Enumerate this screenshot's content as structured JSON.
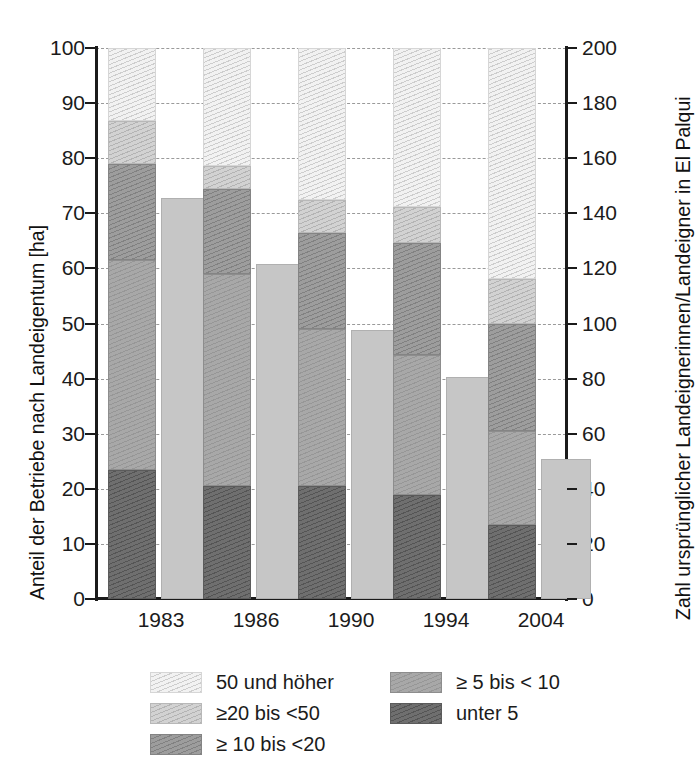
{
  "chart_data": {
    "type": "bar",
    "title": "",
    "subtitle": "",
    "categories": [
      "1983",
      "1986",
      "1990",
      "1994",
      "2004"
    ],
    "ylabel": "Anteil der Betriebe nach Landeigentum [ha]",
    "ylabel_right": "Zahl ursprünglicher Landeignerinnen/Landeigner in El Palqui",
    "xlabel": "",
    "ylim": [
      0,
      100
    ],
    "ylim_right": [
      0,
      200
    ],
    "yticks": [
      0,
      10,
      20,
      30,
      40,
      50,
      60,
      70,
      80,
      90,
      100
    ],
    "yticks_right": [
      0,
      20,
      40,
      60,
      80,
      100,
      120,
      140,
      160,
      180,
      200
    ],
    "grid": true,
    "legend_position": "bottom",
    "stacked": true,
    "series": [
      {
        "name": "unter 5",
        "axis": "left",
        "values": [
          23.5,
          20.5,
          20.5,
          18.8,
          13.5
        ]
      },
      {
        "name": "≥ 5 bis < 10",
        "axis": "left",
        "values": [
          38.0,
          38.5,
          28.5,
          25.5,
          17.0
        ]
      },
      {
        "name": "≥ 10 bis <20",
        "axis": "left",
        "values": [
          17.5,
          15.5,
          17.5,
          20.3,
          19.5
        ]
      },
      {
        "name": "≥20 bis <50",
        "axis": "left",
        "values": [
          7.7,
          4.0,
          6.0,
          6.5,
          8.0
        ]
      },
      {
        "name": "50 und höher",
        "axis": "left",
        "values": [
          13.3,
          21.5,
          27.5,
          28.9,
          42.0
        ]
      },
      {
        "name": "Zahl ursprünglicher Landeignerinnen/Landeigner",
        "axis": "right",
        "stacked": false,
        "values": [
          145,
          121,
          97,
          80,
          50
        ]
      }
    ],
    "stack_tops": {
      "1983": [
        23.5,
        61.5,
        79.0,
        86.7,
        100.0
      ],
      "1986": [
        20.5,
        59.0,
        74.5,
        78.5,
        100.0
      ],
      "1990": [
        20.5,
        49.0,
        66.5,
        72.5,
        100.0
      ],
      "1994": [
        18.8,
        44.3,
        64.6,
        71.1,
        100.0
      ],
      "2004": [
        13.5,
        30.5,
        50.0,
        58.0,
        100.0
      ]
    }
  },
  "axes": {
    "left": {
      "title": "Anteil der Betriebe nach Landeigentum [ha]",
      "ticks": [
        "100",
        "90",
        "80",
        "70",
        "60",
        "50",
        "40",
        "30",
        "20",
        "10",
        "0"
      ]
    },
    "right": {
      "title": "Zahl ursprünglicher Landeignerinnen/Landeigner in El Palqui",
      "ticks": [
        "200",
        "180",
        "160",
        "140",
        "120",
        "100",
        "80",
        "60",
        "40",
        "20",
        "0"
      ]
    },
    "categories": [
      "1983",
      "1986",
      "1990",
      "1994",
      "2004"
    ]
  },
  "legend": {
    "column_1": [
      {
        "label": "50 und höher",
        "fill": "fill-a",
        "color": "#f2f2f2"
      },
      {
        "label": "≥20 bis <50",
        "fill": "fill-b",
        "color": "#d2d2d2"
      },
      {
        "label": "≥ 10 bis <20",
        "fill": "fill-c",
        "color": "#9d9d9d"
      }
    ],
    "column_2": [
      {
        "label": "≥ 5 bis < 10",
        "fill": "fill-d",
        "color": "#a8a8a8"
      },
      {
        "label": "unter 5",
        "fill": "fill-e",
        "color": "#6f6f6f"
      }
    ]
  }
}
